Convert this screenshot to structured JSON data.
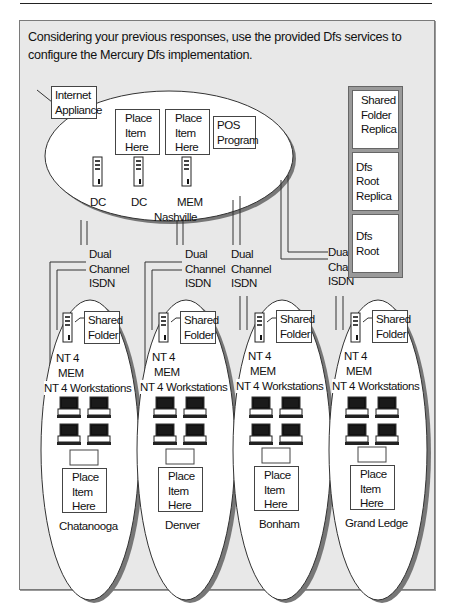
{
  "instruction": "Considering your previous responses, use the provided Dfs services to configure the Mercury Dfs implementation.",
  "hub": {
    "name": "Nashville",
    "internet_label": "Internet Appliance",
    "slots": [
      "Place Item Here",
      "Place Item Here"
    ],
    "pos_label": "POS Program",
    "servers": [
      {
        "label": "DC"
      },
      {
        "label": "DC"
      },
      {
        "label": "MEM"
      }
    ]
  },
  "links": [
    {
      "label_line1": "Dual",
      "label_line2": "Channel",
      "label_line3": "ISDN"
    },
    {
      "label_line1": "Dual",
      "label_line2": "Channel",
      "label_line3": "ISDN"
    },
    {
      "label_line1": "Dual",
      "label_line2": "Channel",
      "label_line3": "ISDN"
    },
    {
      "label_line1": "Dual",
      "label_line2": "Channel",
      "label_line3": "ISDN"
    }
  ],
  "branches": [
    {
      "name": "Chatanooga",
      "shared_folder": "Shared Folder",
      "server_os": "NT 4",
      "server_role": "MEM",
      "workstations_label": "NT 4 Workstations",
      "slot": "Place Item Here"
    },
    {
      "name": "Denver",
      "shared_folder": "Shared Folder",
      "server_os": "NT 4",
      "server_role": "MEM",
      "workstations_label": "NT 4 Workstations",
      "slot": "Place Item Here"
    },
    {
      "name": "Bonham",
      "shared_folder": "Shared Folder",
      "server_os": "NT 4",
      "server_role": "MEM",
      "workstations_label": "NT 4 Workstations",
      "slot": "Place Item Here"
    },
    {
      "name": "Grand Ledge",
      "shared_folder": "Shared Folder",
      "server_os": "NT 4",
      "server_role": "MEM",
      "workstations_label": "NT 4 Workstations",
      "slot": "Place Item Here"
    }
  ],
  "palette": {
    "items": [
      "Shared Folder Replica",
      "Dfs Root Replica",
      "Dfs Root"
    ]
  }
}
